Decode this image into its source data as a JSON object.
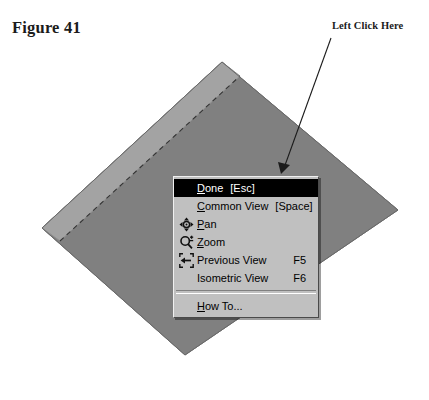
{
  "figure": {
    "caption": "Figure 41"
  },
  "callout": {
    "label": "Left Click Here",
    "line": {
      "x1": 331,
      "y1": 38,
      "x2": 281,
      "y2": 172
    },
    "arrow_tip": {
      "x": 281,
      "y": 172
    }
  },
  "colors": {
    "page_background": "#ffffff",
    "solid_front_face": "#808080",
    "solid_bevel_face": "#a3a3a3",
    "solid_outline": "#5a5a5a",
    "dashed_construction_line": "#3a3a3a",
    "menu_face": "#c0c0c0",
    "menu_highlight_background": "#000000",
    "menu_highlight_text": "#ffffff",
    "menu_text": "#000000",
    "menu_shadow": "rgba(0,0,0,0.38)",
    "label_text": "#1b1b1b"
  },
  "solid": {
    "shape_name": "rotated-extruded-square",
    "front_face_points": "42,228 222,62 398,210 185,355",
    "bevel_face_points": "42,228 222,62 238,74 58,239",
    "dashed_line_points": "58,239 238,74"
  },
  "menu": {
    "name": "view-context-menu",
    "position": {
      "x": 173,
      "y": 176,
      "width": 146
    },
    "items": [
      {
        "id": "done",
        "label_before": "",
        "label_underline": "D",
        "label_after": "one",
        "accel": "[Esc]",
        "accel_align": "inline",
        "icon": null,
        "selected": true
      },
      {
        "id": "common-view",
        "label_before": "",
        "label_underline": "C",
        "label_after": "ommon View",
        "accel": "[Space]",
        "accel_align": "inline",
        "icon": null,
        "selected": false
      },
      {
        "id": "pan",
        "label_before": "",
        "label_underline": "P",
        "label_after": "an",
        "accel": "",
        "accel_align": "inline",
        "icon": "pan-icon",
        "selected": false
      },
      {
        "id": "zoom",
        "label_before": "",
        "label_underline": "Z",
        "label_after": "oom",
        "accel": "",
        "accel_align": "inline",
        "icon": "zoom-icon",
        "selected": false
      },
      {
        "id": "previous-view",
        "label_before": "",
        "label_underline": "",
        "label_after": "Previous View",
        "accel": "F5",
        "accel_align": "right",
        "icon": "previous-view-icon",
        "selected": false
      },
      {
        "id": "isometric-view",
        "label_before": "",
        "label_underline": "",
        "label_after": "Isometric View",
        "accel": "F6",
        "accel_align": "right",
        "icon": null,
        "selected": false
      },
      {
        "id": "separator",
        "separator": true
      },
      {
        "id": "how-to",
        "label_before": "",
        "label_underline": "H",
        "label_after": "ow To...",
        "accel": "",
        "accel_align": "inline",
        "icon": null,
        "selected": false
      }
    ]
  }
}
